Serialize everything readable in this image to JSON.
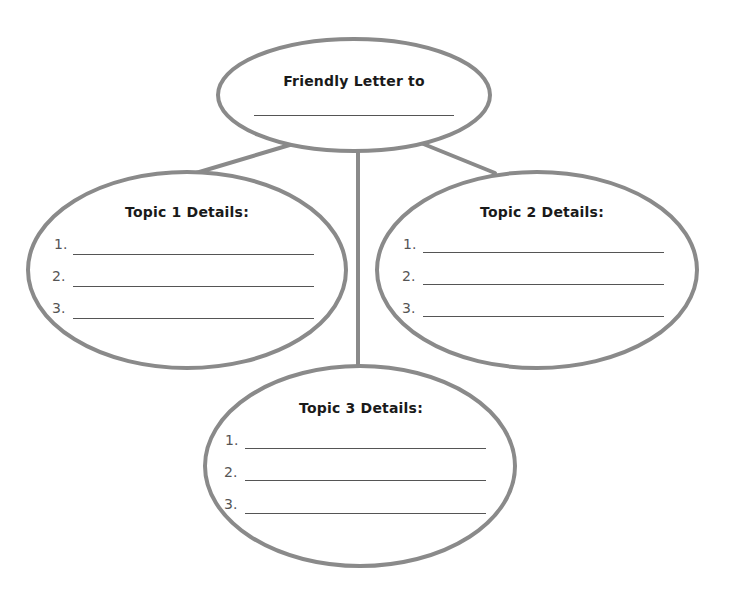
{
  "diagram": {
    "type": "graphic-organizer",
    "colors": {
      "stroke": "#8a8a8a",
      "text": "#1a1a1a",
      "number": "#555555",
      "background": "#ffffff"
    },
    "central_node": {
      "title": "Friendly Letter to",
      "blank": ""
    },
    "topics": [
      {
        "title": "Topic 1 Details:",
        "items": [
          {
            "number": "1.",
            "value": ""
          },
          {
            "number": "2.",
            "value": ""
          },
          {
            "number": "3.",
            "value": ""
          }
        ]
      },
      {
        "title": "Topic 2 Details:",
        "items": [
          {
            "number": "1.",
            "value": ""
          },
          {
            "number": "2.",
            "value": ""
          },
          {
            "number": "3.",
            "value": ""
          }
        ]
      },
      {
        "title": "Topic 3 Details:",
        "items": [
          {
            "number": "1.",
            "value": ""
          },
          {
            "number": "2.",
            "value": ""
          },
          {
            "number": "3.",
            "value": ""
          }
        ]
      }
    ]
  }
}
